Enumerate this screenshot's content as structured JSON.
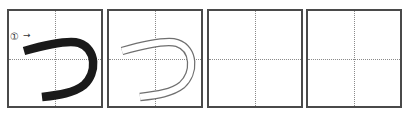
{
  "worksheet": {
    "character": "つ",
    "stroke_count_label": "①",
    "arrow": "→",
    "boxes": [
      {
        "type": "model",
        "stroke_color": "#1a1a1a"
      },
      {
        "type": "trace",
        "outline_color": "#777777"
      },
      {
        "type": "blank"
      },
      {
        "type": "blank"
      }
    ]
  }
}
